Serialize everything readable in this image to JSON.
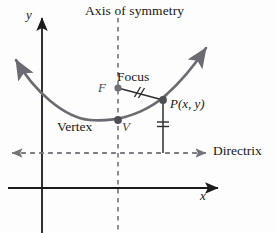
{
  "figure": {
    "type": "geometry-diagram",
    "background_color": "#fdfdfd"
  },
  "labels": {
    "axis_of_symmetry": "Axis of symmetry",
    "focus": "Focus",
    "focus_point": "F",
    "point_p": "P(x, y)",
    "vertex": "Vertex",
    "vertex_point": "V",
    "directrix": "Directrix",
    "y_axis": "y",
    "x_axis": "x"
  },
  "colors": {
    "curve": "#6b6b72",
    "axis": "#1b1b1b",
    "dashed": "#74747c",
    "point": "#6f6f76",
    "text": "#171717"
  },
  "geometry": {
    "vertex": {
      "x": 118,
      "y": 120
    },
    "focus": {
      "x": 118,
      "y": 88
    },
    "point_p": {
      "x": 163,
      "y": 100
    },
    "axis_of_symmetry_x": 118,
    "directrix_y": 153,
    "y_axis_x": 42,
    "x_axis_y": 188,
    "parabola_path": "M 10,56 C 34,92 64,118 90,120 C 96,120.5 104,120.5 112,119.8 C 130,118 150,110 166,96 C 182,82 196,66 208,50"
  },
  "tick_marks": {
    "focus_to_p": "double-slash",
    "p_to_directrix": "double-bar"
  }
}
